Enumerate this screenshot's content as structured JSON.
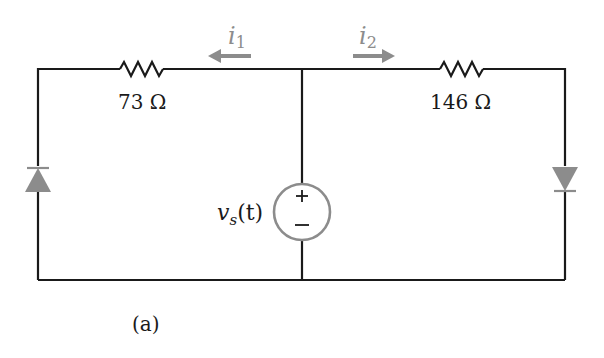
{
  "diagram": {
    "type": "circuit",
    "caption": "(a)",
    "colors": {
      "wire": "#1a1a1a",
      "element_gray": "#8c8c8c",
      "background": "#ffffff"
    },
    "resistors": [
      {
        "id": "R1",
        "label": "73 Ω",
        "branch": "left-top"
      },
      {
        "id": "R2",
        "label": "146 Ω",
        "branch": "right-top"
      }
    ],
    "currents": [
      {
        "id": "i1",
        "symbol": "i",
        "subscript": "1",
        "direction": "left"
      },
      {
        "id": "i2",
        "symbol": "i",
        "subscript": "2",
        "direction": "right"
      }
    ],
    "source": {
      "label_main": "v",
      "label_sub": "s",
      "label_arg": "(t)",
      "plus": "+",
      "minus": "−"
    },
    "diodes": [
      {
        "id": "D1",
        "branch": "left",
        "orientation": "anode-bottom, pointing up"
      },
      {
        "id": "D2",
        "branch": "right",
        "orientation": "anode-top, pointing down"
      }
    ]
  }
}
